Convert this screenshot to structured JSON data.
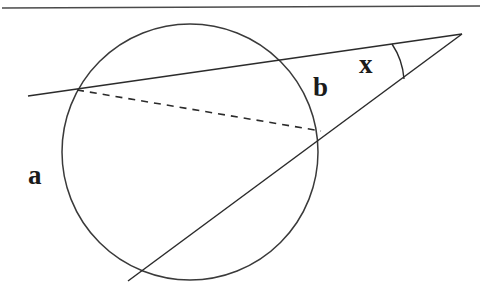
{
  "figure": {
    "background_color": "#ffffff",
    "stroke_color": "#2b2b2b",
    "label_color": "#1b1b1b",
    "width": 482,
    "height": 295
  },
  "labels": {
    "arc_far": "a",
    "arc_near": "b",
    "angle": "x"
  },
  "chart_data": {
    "type": "diagram",
    "elements": {
      "top_rule": {
        "x1": 2,
        "y1": 8,
        "x2": 480,
        "y2": 6
      },
      "circle": {
        "cx": 190,
        "cy": 152,
        "r": 128
      },
      "upper_secant": {
        "x1": 28,
        "y1": 96,
        "x2": 462,
        "y2": 34
      },
      "lower_secant": {
        "x1": 128,
        "y1": 281,
        "x2": 462,
        "y2": 34
      },
      "dashed_chord": {
        "x1": 77,
        "y1": 90,
        "x2": 321,
        "y2": 131
      },
      "angle_arc": {
        "cx": 462,
        "cy": 34,
        "r": 72,
        "start_x": 392,
        "start_y": 44,
        "end_x": 404,
        "end_y": 79
      },
      "apex": {
        "x": 462,
        "y": 34
      },
      "intersections": {
        "upper_secant_left": {
          "x": 77,
          "y": 90
        },
        "upper_secant_right": {
          "x": 290,
          "y": 63
        },
        "lower_secant_left": {
          "x": 136,
          "y": 272
        },
        "lower_secant_right": {
          "x": 321,
          "y": 131
        }
      }
    },
    "label_positions": {
      "a": {
        "x": 38,
        "y": 178
      },
      "b": {
        "x": 323,
        "y": 90
      },
      "x": {
        "x": 369,
        "y": 67
      }
    },
    "ylim": [
      295,
      0
    ],
    "xlim": [
      0,
      482
    ],
    "grid": false,
    "legend": false
  }
}
